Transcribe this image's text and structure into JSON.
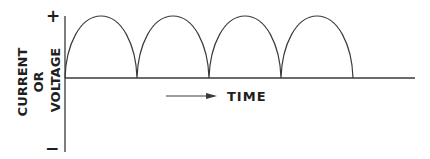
{
  "diagram": {
    "y_axis": {
      "label_lines": [
        "CURRENT",
        "OR",
        "VOLTAGE"
      ],
      "top_marker": "+",
      "bottom_marker": "−"
    },
    "x_axis": {
      "label": "TIME",
      "arrow": "right-arrow"
    },
    "waveform": {
      "type": "full-wave rectified sine (positive half-cycles)",
      "cycles": 4
    },
    "colors": {
      "line": "#3a3a3a",
      "text": "#1f1f1f",
      "background": "#ffffff"
    }
  }
}
